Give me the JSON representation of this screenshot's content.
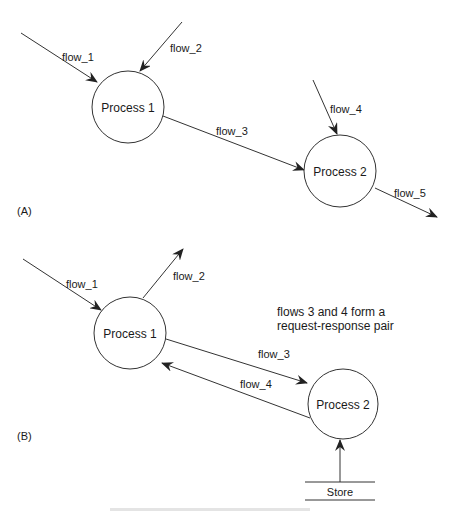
{
  "diagram": {
    "panel_a": {
      "label": "(A)",
      "processes": [
        {
          "id": "p1",
          "label": "Process 1"
        },
        {
          "id": "p2",
          "label": "Process 2"
        }
      ],
      "flows": [
        {
          "id": "flow_1",
          "label": "flow_1",
          "from": "external",
          "to": "Process 1"
        },
        {
          "id": "flow_2",
          "label": "flow_2",
          "from": "external",
          "to": "Process 1"
        },
        {
          "id": "flow_3",
          "label": "flow_3",
          "from": "Process 1",
          "to": "Process 2"
        },
        {
          "id": "flow_4",
          "label": "flow_4",
          "from": "external",
          "to": "Process 2"
        },
        {
          "id": "flow_5",
          "label": "flow_5",
          "from": "Process 2",
          "to": "external"
        }
      ]
    },
    "panel_b": {
      "label": "(B)",
      "note_line1": "flows 3 and 4 form a",
      "note_line2": "request-response pair",
      "processes": [
        {
          "id": "p1",
          "label": "Process 1"
        },
        {
          "id": "p2",
          "label": "Process 2"
        }
      ],
      "store": {
        "label": "Store"
      },
      "flows": [
        {
          "id": "flow_1",
          "label": "flow_1",
          "from": "external",
          "to": "Process 1"
        },
        {
          "id": "flow_2",
          "label": "flow_2",
          "from": "Process 1",
          "to": "external"
        },
        {
          "id": "flow_3",
          "label": "flow_3",
          "from": "Process 1",
          "to": "Process 2"
        },
        {
          "id": "flow_4",
          "label": "flow_4",
          "from": "Process 2",
          "to": "Process 1"
        },
        {
          "id": "store_flow",
          "label": "",
          "from": "Store",
          "to": "Process 2"
        }
      ]
    },
    "colors": {
      "stroke": "#333333",
      "text": "#1a1a1a",
      "background": "#ffffff"
    }
  }
}
